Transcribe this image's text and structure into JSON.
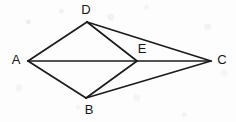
{
  "figure": {
    "background_color": "#fdfdfd",
    "stroke_color": "#1b1b1b",
    "label_color": "#15151a",
    "canvas": {
      "width": 236,
      "height": 122
    },
    "points": [
      {
        "id": "A",
        "label": "A",
        "x": 28,
        "y": 61,
        "label_x": 16,
        "label_y": 61
      },
      {
        "id": "D",
        "label": "D",
        "x": 87,
        "y": 22,
        "label_x": 86,
        "label_y": 11
      },
      {
        "id": "E",
        "label": "E",
        "x": 137,
        "y": 61,
        "label_x": 142,
        "label_y": 50
      },
      {
        "id": "C",
        "label": "C",
        "x": 211,
        "y": 61,
        "label_x": 222,
        "label_y": 61
      },
      {
        "id": "B",
        "label": "B",
        "x": 86,
        "y": 98,
        "label_x": 89,
        "label_y": 111
      }
    ],
    "edges": [
      {
        "id": "AD",
        "from": "A",
        "to": "D",
        "x1": 28,
        "y1": 61,
        "x2": 87,
        "y2": 22
      },
      {
        "id": "AB",
        "from": "A",
        "to": "B",
        "x1": 28,
        "y1": 61,
        "x2": 86,
        "y2": 98
      },
      {
        "id": "AC",
        "from": "A",
        "to": "C",
        "x1": 28,
        "y1": 61,
        "x2": 211,
        "y2": 61
      },
      {
        "id": "DE",
        "from": "D",
        "to": "E",
        "x1": 87,
        "y1": 22,
        "x2": 137,
        "y2": 61
      },
      {
        "id": "DC",
        "from": "D",
        "to": "C",
        "x1": 87,
        "y1": 22,
        "x2": 211,
        "y2": 61
      },
      {
        "id": "BE",
        "from": "B",
        "to": "E",
        "x1": 86,
        "y1": 98,
        "x2": 137,
        "y2": 61
      },
      {
        "id": "BC",
        "from": "B",
        "to": "C",
        "x1": 86,
        "y1": 98,
        "x2": 211,
        "y2": 61
      }
    ]
  }
}
